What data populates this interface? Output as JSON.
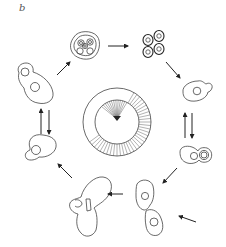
{
  "figure": {
    "panel_label": "b",
    "colors": {
      "line": "#444444",
      "arrow": "#222222",
      "background": "#ffffff"
    }
  },
  "center_clock": {
    "outer_radius": 33,
    "inner_radius": 22,
    "center": [
      117,
      122
    ],
    "hatched_ring_arc_deg": [
      300,
      505
    ],
    "fan_spokes_arc_deg": [
      225,
      300
    ]
  },
  "stages": [
    {
      "id": "tetrad-ascus",
      "label": "ascus with spores",
      "position": [
        84,
        45
      ]
    },
    {
      "id": "free-spores",
      "label": "four spores",
      "position": [
        154,
        45
      ]
    },
    {
      "id": "haploid-budding-right",
      "label": "haploid budding cell",
      "position": [
        197,
        92
      ]
    },
    {
      "id": "zygote-pair",
      "label": "paired haploid cells",
      "position": [
        201,
        155
      ]
    },
    {
      "id": "mating-pair",
      "label": "mating cells",
      "position": [
        152,
        215
      ]
    },
    {
      "id": "shmoo-zygote",
      "label": "zygote",
      "position": [
        89,
        212
      ]
    },
    {
      "id": "diploid-budding-left",
      "label": "diploid budding cell",
      "position": [
        40,
        143
      ]
    },
    {
      "id": "diploid-large",
      "label": "diploid cell with bud",
      "position": [
        28,
        90
      ]
    }
  ],
  "arrows": [
    {
      "from": "diploid-large",
      "to": "tetrad-ascus"
    },
    {
      "from": "tetrad-ascus",
      "to": "free-spores"
    },
    {
      "from": "free-spores",
      "to": "haploid-budding-right"
    },
    {
      "from": "haploid-budding-right",
      "to": "zygote-pair",
      "bidirectional": true
    },
    {
      "from": "zygote-pair",
      "to": "mating-pair"
    },
    {
      "from": "external",
      "to": "mating-pair"
    },
    {
      "from": "external",
      "to": "shmoo-zygote"
    },
    {
      "from": "shmoo-zygote",
      "to": "diploid-budding-left"
    },
    {
      "from": "diploid-budding-left",
      "to": "diploid-large",
      "bidirectional": true
    }
  ]
}
